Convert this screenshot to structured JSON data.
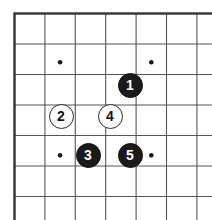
{
  "figure": {
    "board_label": "go-board",
    "background_color": "#ffffff",
    "line_color": "#555555",
    "border_color": "#333333",
    "black_stone_color": "#1a1a1a",
    "white_stone_color": "#fdfdfd"
  },
  "board": {
    "origin_x": 14.5,
    "origin_y": 13.5,
    "cell_w": 30.4,
    "cell_h": 30.5,
    "cols": 7,
    "rows": 7,
    "star_points": [
      {
        "col": 1.5,
        "row": 1.6
      },
      {
        "col": 4.5,
        "row": 1.6
      },
      {
        "col": 1.5,
        "row": 4.65
      },
      {
        "col": 4.5,
        "row": 4.65
      }
    ],
    "stone_diameter": 25
  },
  "stones": [
    {
      "label": "1",
      "color": "black",
      "cx": 130,
      "cy": 85
    },
    {
      "label": "2",
      "color": "white",
      "cx": 61,
      "cy": 116
    },
    {
      "label": "3",
      "color": "black",
      "cx": 88,
      "cy": 155
    },
    {
      "label": "4",
      "color": "white",
      "cx": 110,
      "cy": 116
    },
    {
      "label": "5",
      "color": "black",
      "cx": 130,
      "cy": 155
    }
  ]
}
